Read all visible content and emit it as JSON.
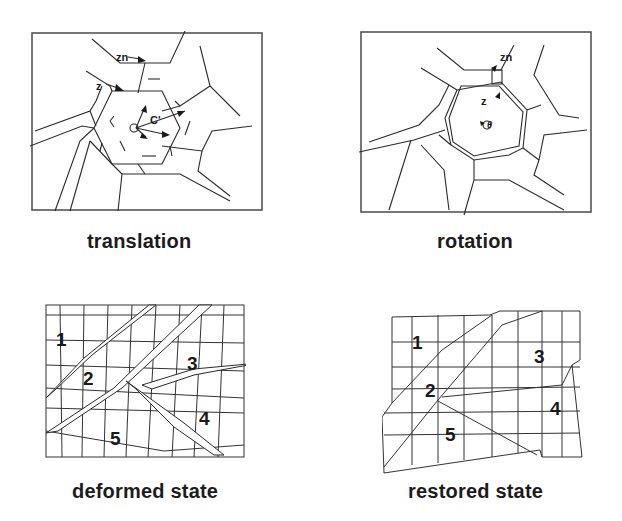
{
  "figure": {
    "panels": [
      {
        "id": "translation",
        "caption": "translation",
        "annotations": [
          "zn",
          "z",
          "C'",
          "v"
        ]
      },
      {
        "id": "rotation",
        "caption": "rotation",
        "annotations": [
          "zn",
          "z",
          "θ"
        ]
      },
      {
        "id": "deformed",
        "caption": "deformed state",
        "regions": [
          "1",
          "2",
          "3",
          "4",
          "5"
        ]
      },
      {
        "id": "restored",
        "caption": "restored state",
        "regions": [
          "1",
          "2",
          "3",
          "4",
          "5"
        ]
      }
    ]
  }
}
